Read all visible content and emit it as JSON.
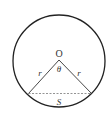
{
  "diagram": {
    "type": "circle-segment",
    "labels": {
      "center": "O",
      "angle": "θ",
      "radius_left": "r",
      "radius_right": "r",
      "segment": "S"
    },
    "colors": {
      "stroke": "#222222",
      "chord": "#888888",
      "text": "#333333"
    }
  }
}
